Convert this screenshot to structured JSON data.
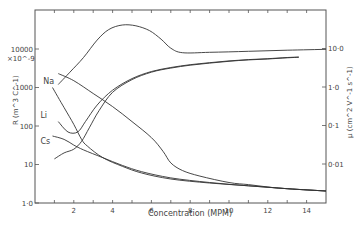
{
  "chart_data": {
    "type": "line",
    "title": "",
    "xlabel": "Concentration (MPM)",
    "ylabel_left": "R (m^3 C^-1)",
    "ylabel_right": "μ (cm^2 V^-1 s^-1)",
    "left_axis_multiplier": "×10^-9",
    "xlim": [
      0,
      15
    ],
    "ylim_left": [
      1.0,
      100000
    ],
    "ylim_right": [
      0.001,
      100
    ],
    "yscale": "log",
    "grid": false,
    "x_ticks": [
      "2",
      "4",
      "6",
      "8",
      "10",
      "12",
      "14"
    ],
    "y_ticks_left": [
      "1·0",
      "10",
      "100",
      "1000",
      "10000"
    ],
    "y_ticks_right": [
      "0·01",
      "0·1",
      "1·0",
      "10·0"
    ],
    "curve_labels": [
      {
        "text": "Na",
        "conc": 1.15,
        "R": 1500
      },
      {
        "text": "Li",
        "conc": 1.0,
        "R": 190
      },
      {
        "text": "Cs",
        "conc": 1.0,
        "R": 40
      }
    ],
    "series": [
      {
        "name": "Na hump",
        "axis": "left",
        "points": [
          [
            1.2,
            1200
          ],
          [
            1.8,
            2500
          ],
          [
            2.5,
            6000
          ],
          [
            3.2,
            17000
          ],
          [
            3.8,
            32000
          ],
          [
            4.5,
            42000
          ],
          [
            5.2,
            40000
          ],
          [
            5.9,
            30000
          ],
          [
            6.5,
            18000
          ],
          [
            7.0,
            10500
          ],
          [
            7.6,
            8000
          ],
          [
            9,
            8200
          ],
          [
            11,
            8700
          ],
          [
            13,
            9300
          ],
          [
            15,
            9800
          ]
        ]
      },
      {
        "name": "Na R",
        "axis": "left",
        "points": [
          [
            1.2,
            2300
          ],
          [
            2,
            1500
          ],
          [
            3,
            700
          ],
          [
            4,
            320
          ],
          [
            5,
            130
          ],
          [
            6,
            50
          ],
          [
            6.6,
            22
          ],
          [
            7.0,
            11
          ],
          [
            7.6,
            7
          ],
          [
            8.5,
            5
          ],
          [
            10,
            3.4
          ],
          [
            11,
            3.0
          ],
          [
            12,
            2.6
          ],
          [
            13,
            2.35
          ],
          [
            15,
            2.05
          ]
        ]
      },
      {
        "name": "Li R",
        "axis": "left",
        "points": [
          [
            0.9,
            1000
          ],
          [
            1.5,
            300
          ],
          [
            2,
            110
          ],
          [
            2.4,
            45
          ],
          [
            2.7,
            30
          ],
          [
            3.5,
            15
          ],
          [
            4.5,
            9
          ],
          [
            5.5,
            6
          ],
          [
            7,
            4.2
          ],
          [
            9,
            3.3
          ],
          [
            11,
            2.8
          ],
          [
            13,
            2.35
          ],
          [
            15,
            2.05
          ]
        ]
      },
      {
        "name": "Cs R",
        "axis": "left",
        "points": [
          [
            0.9,
            55
          ],
          [
            1.5,
            45
          ],
          [
            2,
            32
          ],
          [
            2.5,
            24
          ],
          [
            3.5,
            15
          ],
          [
            4.5,
            9.5
          ],
          [
            5.5,
            6.5
          ],
          [
            7,
            4.5
          ],
          [
            9,
            3.4
          ],
          [
            11,
            2.8
          ],
          [
            13,
            2.35
          ],
          [
            15,
            2.05
          ]
        ]
      },
      {
        "name": "Li mobility",
        "axis": "right",
        "points": [
          [
            1.2,
            0.13
          ],
          [
            1.7,
            0.07
          ],
          [
            2.2,
            0.07
          ],
          [
            2.6,
            0.13
          ],
          [
            3.2,
            0.35
          ],
          [
            4,
            0.85
          ],
          [
            5,
            1.7
          ],
          [
            6,
            2.6
          ],
          [
            7,
            3.3
          ],
          [
            8,
            3.9
          ],
          [
            9,
            4.4
          ],
          [
            10,
            4.9
          ],
          [
            11,
            5.3
          ],
          [
            12,
            5.6
          ],
          [
            13,
            6.0
          ],
          [
            13.6,
            6.2
          ]
        ]
      },
      {
        "name": "Cs mobility",
        "axis": "right",
        "points": [
          [
            1.0,
            0.014
          ],
          [
            1.5,
            0.02
          ],
          [
            2,
            0.025
          ],
          [
            2.4,
            0.04
          ],
          [
            2.8,
            0.09
          ],
          [
            3.3,
            0.25
          ],
          [
            4,
            0.75
          ],
          [
            5,
            1.6
          ],
          [
            6,
            2.5
          ],
          [
            7,
            3.2
          ],
          [
            8,
            3.8
          ],
          [
            9,
            4.3
          ],
          [
            10,
            4.8
          ],
          [
            11,
            5.2
          ],
          [
            12,
            5.5
          ],
          [
            13,
            5.9
          ],
          [
            13.6,
            6.1
          ]
        ]
      }
    ]
  }
}
